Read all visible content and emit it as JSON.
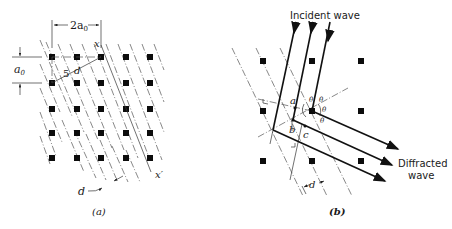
{
  "figure": {
    "panel_a": {
      "caption": "(a)",
      "labels": {
        "width_dim": "2a",
        "width_sub": "0",
        "height_dim": "a",
        "height_sub": "0",
        "x_top": "x",
        "x_bottom": "x′",
        "diag": "5",
        "diag_d": "d",
        "spacing": "d"
      },
      "lattice": {
        "cols": 5,
        "rows": 5,
        "origin": [
          52,
          57
        ],
        "spacing": 24.5
      }
    },
    "panel_b": {
      "caption": "(b)",
      "labels": {
        "incident": "Incident wave",
        "diffracted_line1": "Diffracted",
        "diffracted_line2": "wave",
        "point_a": "a",
        "point_b": "b",
        "point_c": "c",
        "theta": "θ",
        "spacing": "d"
      },
      "lattice": {
        "cols": 3,
        "rows": 3,
        "origin": [
          263,
          61
        ],
        "spacing": 49.5
      }
    }
  },
  "colors": {
    "ink": "#111111",
    "dash": "#555555",
    "background": "#ffffff"
  }
}
